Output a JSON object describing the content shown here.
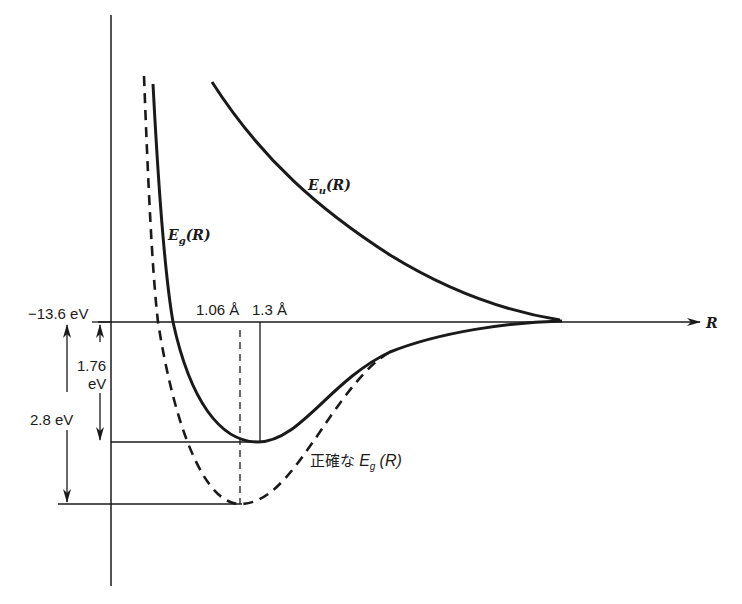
{
  "diagram": {
    "type": "potential-energy-curves",
    "axis": {
      "x_label": "R",
      "zero_level_label": "−13.6 eV"
    },
    "curves": [
      {
        "name": "E_u(R)",
        "label_main": "E",
        "label_sub": "u",
        "label_arg": "(R)",
        "style": "solid"
      },
      {
        "name": "E_g(R)",
        "label_main": "E",
        "label_sub": "g",
        "label_arg": "(R)",
        "style": "solid"
      },
      {
        "name": "exact E_g(R)",
        "label_prefix": "正確な",
        "label_main": "E",
        "label_sub": "g",
        "label_arg": "(R)",
        "style": "dashed"
      }
    ],
    "annotations": {
      "r1": "1.06 Å",
      "r2": "1.3 Å",
      "depth1_value": "1.76",
      "depth1_unit": "eV",
      "depth2": "2.8 eV"
    }
  }
}
